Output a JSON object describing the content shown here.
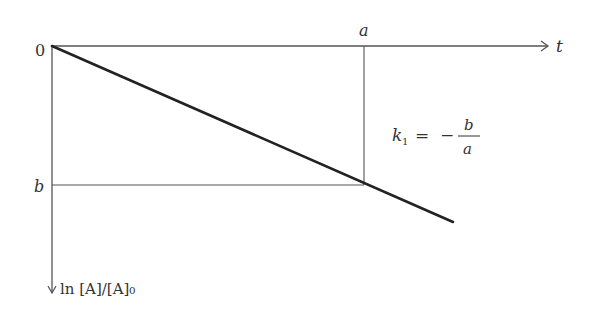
{
  "diagram": {
    "x_axis": {
      "label": "t",
      "origin_label": "0"
    },
    "y_axis": {
      "label": "ln [A]/[A]₀"
    },
    "markers": {
      "x_marker": "a",
      "y_marker": "b"
    },
    "formula": {
      "lhs": "k",
      "lhs_subscript": "1",
      "equals": "=",
      "sign": "−",
      "numerator": "b",
      "denominator": "a",
      "full_text": "k₁ = − b/a"
    },
    "line": {
      "description": "straight line with negative slope starting at origin",
      "start": [
        0,
        0
      ],
      "passes_through": [
        "a",
        "b"
      ]
    },
    "colors": {
      "line": "#222222",
      "axis": "#555555",
      "text": "#333333",
      "background": "#ffffff"
    }
  }
}
